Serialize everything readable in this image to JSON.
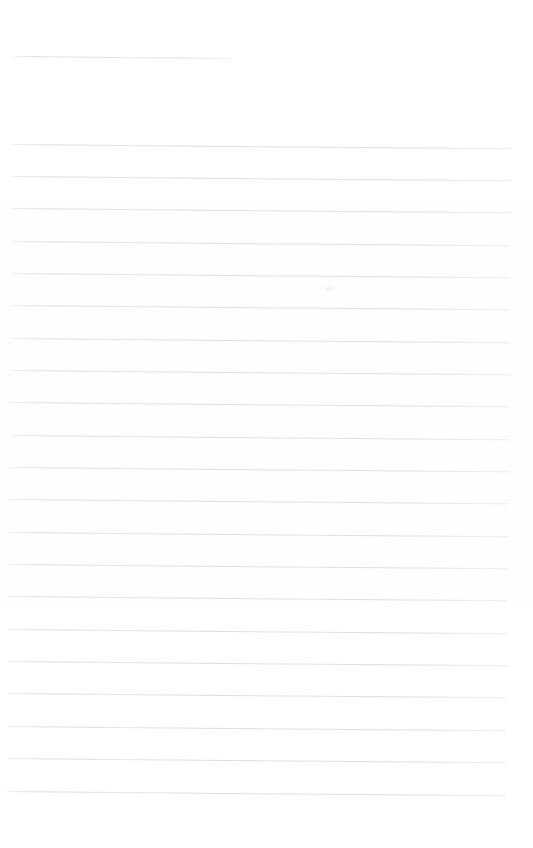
{
  "document": {
    "kind": "scanned-ruled-paper",
    "title": "",
    "body_text": "",
    "background_color": "#ffffff",
    "rule_color": "#d9dbde",
    "header_rule_color": "#dcdee1",
    "page": {
      "width": 533,
      "height": 848
    },
    "scan": {
      "skew_degrees": 0.48,
      "artifact_note": ""
    }
  },
  "ruling": {
    "left_margin_x": 14,
    "right_edge_x": 513,
    "line_spacing": 32.4,
    "full_width_line_count": 21,
    "header_rule": {
      "y": 56,
      "x_start": 14,
      "x_end": 230,
      "width": 216
    },
    "lines": [
      {
        "y": 144,
        "x_start": 14,
        "x_end": 513
      },
      {
        "y": 176,
        "x_start": 14,
        "x_end": 513
      },
      {
        "y": 208,
        "x_start": 14,
        "x_end": 512
      },
      {
        "y": 241,
        "x_start": 14,
        "x_end": 512
      },
      {
        "y": 273,
        "x_start": 14,
        "x_end": 513
      },
      {
        "y": 305,
        "x_start": 14,
        "x_end": 512
      },
      {
        "y": 338,
        "x_start": 14,
        "x_end": 512
      },
      {
        "y": 370,
        "x_start": 14,
        "x_end": 513
      },
      {
        "y": 402,
        "x_start": 14,
        "x_end": 512
      },
      {
        "y": 435,
        "x_start": 14,
        "x_end": 512
      },
      {
        "y": 467,
        "x_start": 14,
        "x_end": 513
      },
      {
        "y": 499,
        "x_start": 14,
        "x_end": 512
      },
      {
        "y": 532,
        "x_start": 14,
        "x_end": 512
      },
      {
        "y": 564,
        "x_start": 14,
        "x_end": 513
      },
      {
        "y": 596,
        "x_start": 14,
        "x_end": 512
      },
      {
        "y": 629,
        "x_start": 14,
        "x_end": 512
      },
      {
        "y": 661,
        "x_start": 14,
        "x_end": 513
      },
      {
        "y": 693,
        "x_start": 14,
        "x_end": 512
      },
      {
        "y": 726,
        "x_start": 14,
        "x_end": 512
      },
      {
        "y": 758,
        "x_start": 14,
        "x_end": 513
      },
      {
        "y": 791,
        "x_start": 14,
        "x_end": 512
      }
    ]
  },
  "artifacts": {
    "speck": {
      "x": 325,
      "y": 286
    }
  }
}
